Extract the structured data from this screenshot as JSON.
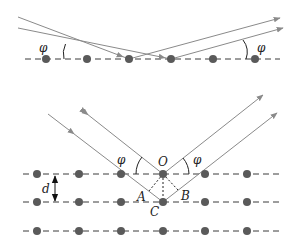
{
  "diagram": {
    "colors": {
      "ray": "#8a8a8a",
      "atom": "#5a5a5a",
      "dash": "#3a3a3a",
      "text": "#222222",
      "arc": "#222222"
    },
    "top_panel": {
      "description": "Reflection from a single atomic plane",
      "angle_label_left": "φ",
      "angle_label_right": "φ",
      "atom_count": 6
    },
    "bottom_panel": {
      "description": "Reflection from successive planes separated by d",
      "angle_label_left": "φ",
      "angle_label_right": "φ",
      "point_O": "O",
      "point_A": "A",
      "point_B": "B",
      "point_C": "C",
      "spacing_label": "d",
      "plane_count": 3,
      "atoms_per_plane": 6
    }
  }
}
